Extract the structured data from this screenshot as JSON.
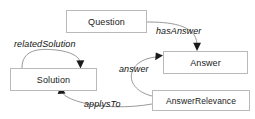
{
  "diagram": {
    "type": "ontology-relationship-diagram",
    "background_color": "#ffffff",
    "box_border_color": "#b9b9b9",
    "connector_color": "#9a9a9a",
    "text_color": "#1a1a1a",
    "nodes": [
      {
        "id": "question",
        "label": "Question"
      },
      {
        "id": "answer",
        "label": "Answer"
      },
      {
        "id": "answerrelevance",
        "label": "AnswerRelevance"
      },
      {
        "id": "solution",
        "label": "Solution"
      }
    ],
    "edges": [
      {
        "id": "hasanswer",
        "label": "hasAnswer",
        "from": "question",
        "to": "answer"
      },
      {
        "id": "relatedsolution",
        "label": "relatedSolution",
        "from": "solution",
        "to": "solution"
      },
      {
        "id": "answer",
        "label": "answer",
        "from": "answerrelevance",
        "to": "answer"
      },
      {
        "id": "applysto",
        "label": "applysTo",
        "from": "answerrelevance",
        "to": "solution"
      }
    ]
  }
}
